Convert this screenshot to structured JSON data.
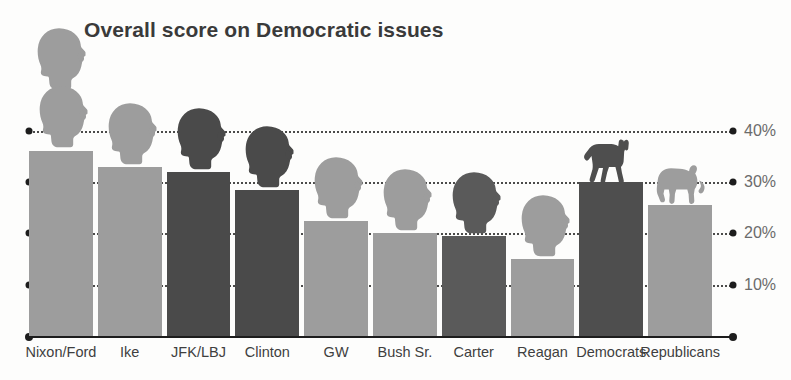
{
  "chart_data": {
    "type": "bar",
    "title": "Overall score on Democratic issues",
    "xlabel": "",
    "ylabel": "",
    "ylim": [
      0,
      45
    ],
    "grid": true,
    "legend": "none",
    "y_ticks": [
      10,
      20,
      30,
      40
    ],
    "y_tick_labels": [
      "10%",
      "20%",
      "30%",
      "40%"
    ],
    "categories": [
      "Nixon/Ford",
      "Ike",
      "JFK/LBJ",
      "Clinton",
      "GW",
      "Bush Sr.",
      "Carter",
      "Reagan",
      "Democrats",
      "Republicans"
    ],
    "values": [
      36,
      33,
      32,
      28.5,
      22.5,
      20,
      19.5,
      15,
      30,
      25.5
    ],
    "bar_colors": [
      "#9d9d9d",
      "#9d9d9d",
      "#4a4a4a",
      "#4a4a4a",
      "#9d9d9d",
      "#9d9d9d",
      "#5a5a5a",
      "#9d9d9d",
      "#4e4e4e",
      "#9d9d9d"
    ],
    "icons": [
      "president-head-icon",
      "president-head-icon",
      "president-head-icon",
      "president-head-icon",
      "president-head-icon",
      "president-head-icon",
      "president-head-icon",
      "president-head-icon",
      "donkey-icon",
      "elephant-icon"
    ]
  },
  "colors": {
    "bar_light": "#9d9d9d",
    "bar_dark": "#4a4a4a",
    "axis": "#1d1d1d",
    "title": "#3a3a3a",
    "tick_text": "#6b6b6b",
    "background": "#fdfdfc"
  }
}
